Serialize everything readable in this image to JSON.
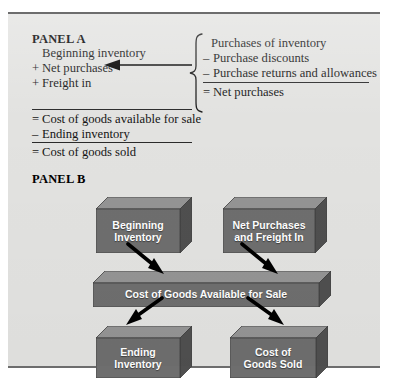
{
  "figure": {
    "background_color": "#e2e2e0",
    "border_color": "#6d6d6d"
  },
  "panel_a": {
    "title": "PANEL A",
    "left_column": [
      {
        "op": "",
        "text": "Beginning inventory"
      },
      {
        "op": "+",
        "text": "Net purchases"
      },
      {
        "op": "+",
        "text": "Freight in"
      },
      {
        "op": "=",
        "text": "Cost of goods available for sale"
      },
      {
        "op": "–",
        "text": "Ending inventory"
      },
      {
        "op": "=",
        "text": "Cost of goods sold"
      }
    ],
    "right_column": [
      {
        "op": "",
        "text": "Purchases of inventory"
      },
      {
        "op": "–",
        "text": "Purchase discounts"
      },
      {
        "op": "–",
        "text": "Purchase returns and allowances"
      },
      {
        "op": "=",
        "text": "Net purchases"
      }
    ],
    "brace": "left-curly-brace",
    "arrow": "left-pointing-arrow"
  },
  "panel_b": {
    "title": "PANEL B",
    "boxes": [
      {
        "id": "beginning-inventory",
        "lines": [
          "Beginning",
          "Inventory"
        ]
      },
      {
        "id": "net-purchases-and-freight-in",
        "lines": [
          "Net Purchases",
          "and Freight In"
        ]
      },
      {
        "id": "cost-of-goods-available",
        "lines": [
          "Cost of Goods Available for Sale"
        ]
      },
      {
        "id": "ending-inventory",
        "lines": [
          "Ending",
          "Inventory"
        ]
      },
      {
        "id": "cost-of-goods-sold",
        "lines": [
          "Cost of",
          "Goods Sold"
        ]
      }
    ],
    "box_colors": {
      "front": "#6e6e6e",
      "top": "#949494",
      "side": "#4f4f4f",
      "text": "#ffffff"
    },
    "arrow_color": "#000000",
    "arrows": [
      {
        "from": "beginning-inventory",
        "to": "cost-of-goods-available"
      },
      {
        "from": "net-purchases-and-freight-in",
        "to": "cost-of-goods-available"
      },
      {
        "from": "cost-of-goods-available",
        "to": "ending-inventory"
      },
      {
        "from": "cost-of-goods-available",
        "to": "cost-of-goods-sold"
      }
    ]
  }
}
